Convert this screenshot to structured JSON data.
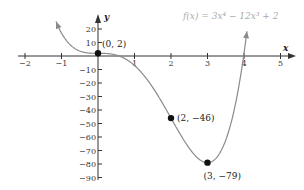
{
  "chart_data": {
    "type": "line",
    "title": "f(x) = 3x⁴ − 12x³ + 2",
    "function": "3x^4 - 12x^3 + 2",
    "xlabel": "x",
    "ylabel": "y",
    "xlim": [
      -2,
      5.3
    ],
    "ylim": [
      -93,
      30
    ],
    "x_ticks": [
      -2,
      -1,
      1,
      2,
      3,
      4,
      5
    ],
    "x_tick_labels": [
      "−2",
      "−1",
      "1",
      "2",
      "3",
      "4",
      "5"
    ],
    "y_ticks": [
      20,
      10,
      -10,
      -20,
      -30,
      -40,
      -50,
      -60,
      -70,
      -80,
      -90
    ],
    "y_tick_labels": [
      "20",
      "10",
      "−10",
      "−20",
      "−30",
      "−40",
      "−50",
      "−60",
      "−70",
      "−80",
      "−90"
    ],
    "grid": false,
    "legend": "none",
    "series": [
      {
        "name": "f(x)",
        "x_range": [
          -1.15,
          4.08
        ],
        "color": "#888888"
      }
    ],
    "points": [
      {
        "x": 0,
        "y": 2,
        "label": "(0, 2)"
      },
      {
        "x": 2,
        "y": -46,
        "label": "(2, −46)"
      },
      {
        "x": 3,
        "y": -79,
        "label": "(3, −79)"
      }
    ],
    "annotations": [
      "f(x) = 3x⁴ − 12x³ + 2"
    ]
  },
  "colors": {
    "axis": "#333333",
    "curve": "#8a8a8a",
    "point": "#111111",
    "function_label": "#aaaaaa"
  }
}
